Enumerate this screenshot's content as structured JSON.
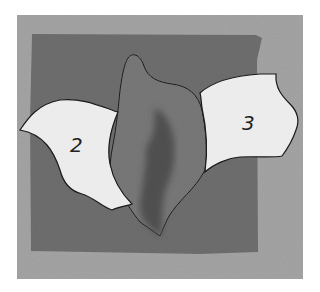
{
  "image": {
    "description": "Grayscale photograph of a fabric appliqué practice piece: three cut shapes laid on a square of dark textured fabric over a gray background.",
    "colors": {
      "page": "#ffffff",
      "background": "#a4a4a4",
      "fabric_square": "#6e6e6e",
      "center_piece": "#787878",
      "center_shadow": "#4e4e4e",
      "paper_pieces": "#ececec",
      "outline": "#1a1a1a",
      "label_ink": "#222222"
    },
    "pieces": [
      {
        "id": "piece-2",
        "label": "2"
      },
      {
        "id": "piece-center",
        "label": ""
      },
      {
        "id": "piece-3",
        "label": "3"
      }
    ]
  }
}
